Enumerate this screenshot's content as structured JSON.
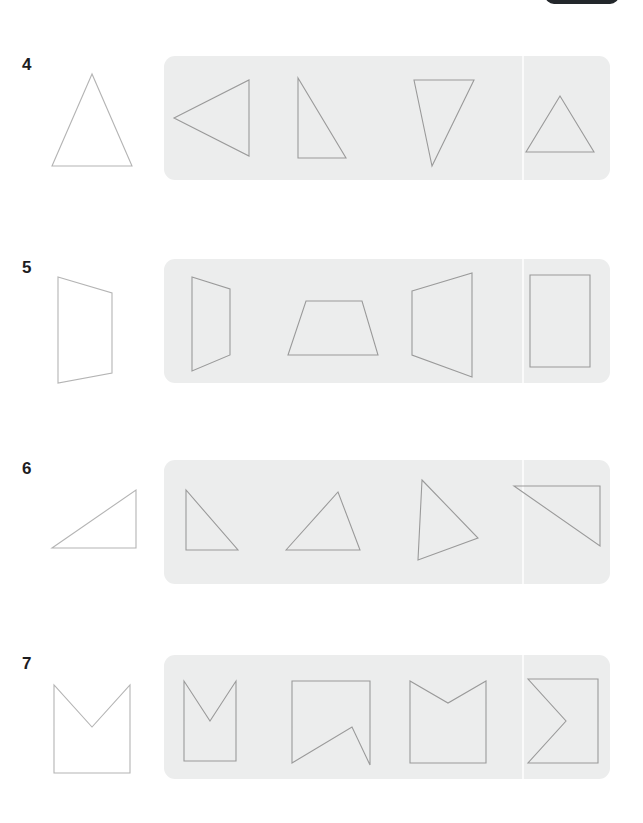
{
  "page": {
    "background_color": "#ffffff",
    "panel_color": "#eceded",
    "separator_color": "#fbfbfb",
    "stroke_color": "#9a9a9a",
    "reference_stroke_color": "#b4b4b4",
    "number_color": "#1d1d1f",
    "top_badge_color": "#23272b"
  },
  "top_partial_badge": {
    "label": "",
    "icon": "partial-pill-cutoff"
  },
  "rows": [
    {
      "number": "4",
      "top": 56,
      "reference": {
        "name": "isoceles-triangle-upright",
        "points": "52,12 12,104 92,104",
        "viewBox": "0 0 120 120"
      },
      "options": [
        {
          "name": "triangle-pointing-left",
          "points": "10,62 85,24 85,100",
          "viewBox": "0 0 112 124"
        },
        {
          "name": "right-triangle-vertical-left",
          "points": "22,22 22,102 70,102",
          "viewBox": "0 0 112 124"
        },
        {
          "name": "narrow-triangle-pointing-down",
          "points": "18,24 78,24 36,110",
          "viewBox": "0 0 112 124"
        },
        {
          "name": "equilateral-triangle-upright",
          "points": "56,40 22,96 90,96",
          "viewBox": "0 0 112 124"
        }
      ]
    },
    {
      "number": "5",
      "top": 259,
      "reference": {
        "name": "quadrilateral-slanted-left-edge",
        "points": "18,12 72,28 72,108 18,118",
        "viewBox": "0 0 120 120"
      },
      "options": [
        {
          "name": "narrow-trapezoid-vertical-left",
          "points": "28,18 66,30 66,96 28,112",
          "viewBox": "0 0 112 124"
        },
        {
          "name": "wide-trapezoid-base-down",
          "points": "30,42 86,42 102,96 12,96",
          "viewBox": "0 0 112 124"
        },
        {
          "name": "trapezoid-vertical-left-slanted-right",
          "points": "16,32 76,14 76,118 16,96",
          "viewBox": "0 0 112 124"
        },
        {
          "name": "rectangle-upright",
          "points": "26,16 86,16 86,108 26,108",
          "viewBox": "0 0 112 124"
        }
      ]
    },
    {
      "number": "6",
      "top": 460,
      "reference": {
        "name": "right-triangle-apex-top-right",
        "points": "12,82 96,24 96,82",
        "viewBox": "0 0 120 120"
      },
      "options": [
        {
          "name": "right-triangle-vertical-left-hypotenuse-down-right",
          "points": "22,30 22,90 74,90",
          "viewBox": "0 0 112 124"
        },
        {
          "name": "right-triangle-apex-top-right-wide",
          "points": "10,90 62,32 84,90",
          "viewBox": "0 0 112 124"
        },
        {
          "name": "right-triangle-apex-top-left-tall",
          "points": "26,20 82,78 22,100",
          "viewBox": "0 0 112 124"
        },
        {
          "name": "right-triangle-top-horizontal-right-vertical",
          "points": "10,26 96,26 96,86",
          "viewBox": "0 0 112 124"
        }
      ]
    },
    {
      "number": "7",
      "top": 655,
      "reference": {
        "name": "square-with-v-notch-top",
        "points": "14,24 14,112 90,112 90,24 52,66",
        "viewBox": "0 0 120 120"
      },
      "options": [
        {
          "name": "square-with-v-notch-top-deep",
          "points": "20,26 20,106 72,106 72,26 46,66",
          "viewBox": "0 0 112 124"
        },
        {
          "name": "square-with-v-notch-bottom",
          "points": "16,26 94,26 94,110 76,72 16,108",
          "viewBox": "0 0 112 124"
        },
        {
          "name": "square-with-v-notch-top-shallow",
          "points": "14,26 14,108 90,108 90,26 52,48",
          "viewBox": "0 0 112 124"
        },
        {
          "name": "square-with-v-notch-left",
          "points": "24,24 94,24 94,108 24,108 62,66",
          "viewBox": "0 0 112 124"
        }
      ],
      "separator_x": 358
    }
  ],
  "panel": {
    "option_slot_width": 112,
    "separator_offset_x": 358
  }
}
